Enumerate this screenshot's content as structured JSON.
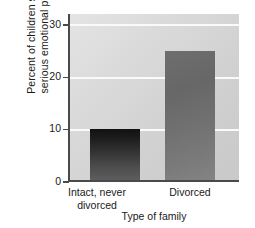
{
  "chart_data": {
    "type": "bar",
    "title": "",
    "subtitle": "",
    "xlabel": "Type of family",
    "ylabel": "Percent of children showing serious emotional problems",
    "ylabel_lines": [
      "Percent of children showing",
      "serious emotional problems"
    ],
    "categories": [
      "Intact, never divorced",
      "Divorced"
    ],
    "category_lines": [
      [
        "Intact, never",
        "divorced"
      ],
      [
        "Divorced"
      ]
    ],
    "values": [
      10,
      25
    ],
    "ylim": [
      0,
      32
    ],
    "yticks": [
      0,
      10,
      20,
      30
    ],
    "ytick_labels": [
      "0",
      "10",
      "20",
      "30"
    ],
    "gridlines": [
      10,
      20,
      30
    ],
    "grid": true,
    "legend": "none",
    "bar_colors": [
      "#1f1f1f",
      "#737373"
    ],
    "plot_background": "#d8d8d8",
    "gridline_color": "#fafafa",
    "axis_color": "#4a4a4a",
    "page_background": "#ffffff"
  }
}
